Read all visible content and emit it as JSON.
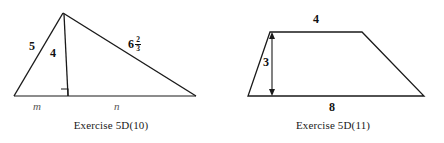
{
  "page": {
    "background_color": "#ffffff",
    "stroke_color": "#1a1a1a",
    "label_color": "#111111",
    "variable_label_color": "#555555"
  },
  "figures": [
    {
      "id": "triangle",
      "caption": "Exercise 5D(10)",
      "shape": "triangle-with-altitude",
      "labels": {
        "left_side": "5",
        "altitude": "4",
        "right_side_whole": "6",
        "right_side_numerator": "2",
        "right_side_denominator": "3",
        "base_left_segment": "m",
        "base_right_segment": "n"
      },
      "marks": {
        "right_angle": "right-angle-square"
      },
      "geometry": {
        "apex": [
          63,
          13
        ],
        "base_left": [
          14,
          96
        ],
        "base_right": [
          196,
          96
        ],
        "altitude_foot": [
          68,
          96
        ]
      }
    },
    {
      "id": "trapezoid",
      "caption": "Exercise 5D(11)",
      "shape": "trapezoid-with-height",
      "labels": {
        "top_side": "4",
        "height": "3",
        "bottom_side": "8"
      },
      "marks": {
        "height_arrow": "double-headed-arrow"
      },
      "geometry": {
        "top_left": [
          48,
          32
        ],
        "top_right": [
          140,
          32
        ],
        "bottom_right": [
          202,
          96
        ],
        "bottom_left": [
          26,
          96
        ],
        "arrow_x": 50,
        "arrow_top_y": 33,
        "arrow_bottom_y": 96
      }
    }
  ]
}
